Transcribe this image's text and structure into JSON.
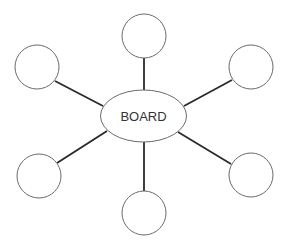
{
  "diagram": {
    "type": "hub-and-spoke",
    "hub": {
      "label": "BOARD",
      "cx": 143.5,
      "cy": 116,
      "rx": 43,
      "ry": 26
    },
    "nodes": [
      {
        "id": "top",
        "label": "",
        "cx": 144,
        "cy": 36,
        "r": 22
      },
      {
        "id": "upper-right",
        "label": "",
        "cx": 251,
        "cy": 67,
        "r": 22
      },
      {
        "id": "lower-right",
        "label": "",
        "cx": 251,
        "cy": 175,
        "r": 22
      },
      {
        "id": "bottom",
        "label": "",
        "cx": 144,
        "cy": 213,
        "r": 22
      },
      {
        "id": "lower-left",
        "label": "",
        "cx": 39,
        "cy": 176,
        "r": 22
      },
      {
        "id": "upper-left",
        "label": "",
        "cx": 37,
        "cy": 67,
        "r": 22
      }
    ],
    "edges": [
      {
        "from": "hub",
        "to": "top",
        "x1": 144,
        "y1": 90,
        "x2": 144,
        "y2": 58
      },
      {
        "from": "hub",
        "to": "upper-right",
        "x1": 184,
        "y1": 106,
        "x2": 232,
        "y2": 80
      },
      {
        "from": "hub",
        "to": "lower-right",
        "x1": 178,
        "y1": 132,
        "x2": 231,
        "y2": 164
      },
      {
        "from": "hub",
        "to": "bottom",
        "x1": 144,
        "y1": 142,
        "x2": 144,
        "y2": 191
      },
      {
        "from": "hub",
        "to": "lower-left",
        "x1": 107,
        "y1": 131,
        "x2": 57,
        "y2": 163
      },
      {
        "from": "hub",
        "to": "upper-left",
        "x1": 103,
        "y1": 106,
        "x2": 55,
        "y2": 81
      }
    ],
    "colors": {
      "background": "#ffffff",
      "edge": "#2a2a2a",
      "outline": "#6a6a6a",
      "text": "#333333"
    }
  }
}
